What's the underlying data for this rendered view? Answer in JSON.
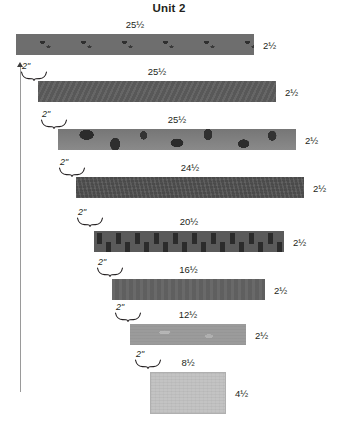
{
  "title": "Unit 2",
  "units": "inches",
  "vertical_arrow": {
    "name": "left-up-arrow",
    "direction": "up"
  },
  "strips": [
    {
      "width_label": "25½",
      "height_label": "2½",
      "fabric": "dark-gray-scattered-dots",
      "left": 16,
      "top": 34,
      "width": 238,
      "height": 21
    },
    {
      "width_label": "25½",
      "height_label": "2½",
      "fabric": "solid-dark-gray",
      "left": 38,
      "top": 81,
      "width": 238,
      "height": 21
    },
    {
      "width_label": "25½",
      "height_label": "2½",
      "fabric": "bold-floral-print",
      "left": 58,
      "top": 129,
      "width": 238,
      "height": 21
    },
    {
      "width_label": "24½",
      "height_label": "2½",
      "fabric": "dark-gray-textured",
      "left": 76,
      "top": 177,
      "width": 228,
      "height": 21
    },
    {
      "width_label": "20½",
      "height_label": "2½",
      "fabric": "gray-dash-print",
      "left": 94,
      "top": 231,
      "width": 190,
      "height": 21
    },
    {
      "width_label": "16½",
      "height_label": "2½",
      "fabric": "solid-medium-gray",
      "left": 112,
      "top": 279,
      "width": 153,
      "height": 21
    },
    {
      "width_label": "12½",
      "height_label": "2½",
      "fabric": "light-gray-print",
      "left": 130,
      "top": 324,
      "width": 116,
      "height": 21
    },
    {
      "width_label": "8½",
      "height_label": "4½",
      "fabric": "lightest-gray-solid",
      "left": 150,
      "top": 372,
      "width": 76,
      "height": 42
    }
  ],
  "braces": [
    {
      "label": "2\"",
      "left": 20,
      "top": 62
    },
    {
      "label": "2\"",
      "left": 40,
      "top": 110
    },
    {
      "label": "2\"",
      "left": 58,
      "top": 158
    },
    {
      "label": "2\"",
      "left": 76,
      "top": 208
    },
    {
      "label": "2\"",
      "left": 96,
      "top": 258
    },
    {
      "label": "2\"",
      "left": 114,
      "top": 303
    },
    {
      "label": "2\"",
      "left": 134,
      "top": 350
    }
  ]
}
